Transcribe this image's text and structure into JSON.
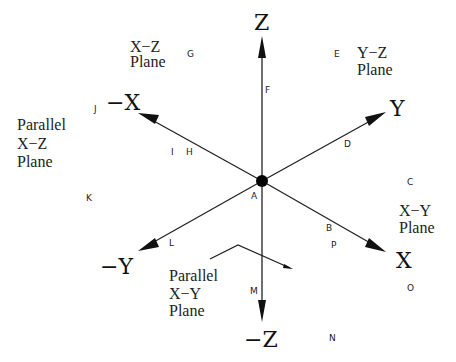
{
  "diagram": {
    "origin": {
      "label": "A",
      "x": 262,
      "y": 181
    },
    "axes": {
      "z_pos": {
        "label": "Z"
      },
      "z_neg": {
        "label": "−Z"
      },
      "y_pos": {
        "label": "Y"
      },
      "y_neg": {
        "label": "−Y"
      },
      "x_pos": {
        "label": "X"
      },
      "x_neg": {
        "label": "−X"
      }
    },
    "planes": {
      "xz": {
        "line1": "X−Z",
        "line2": "Plane"
      },
      "yz": {
        "line1": "Y−Z",
        "line2": "Plane"
      },
      "xy": {
        "line1": "X−Y",
        "line2": "Plane"
      },
      "parallel_xz": {
        "line1": "Parallel",
        "line2": "X−Z",
        "line3": "Plane"
      },
      "parallel_xy": {
        "line1": "Parallel",
        "line2": "X−Y",
        "line3": "Plane"
      }
    },
    "points": {
      "A": "A",
      "B": "B",
      "C": "C",
      "D": "D",
      "E": "E",
      "F": "F",
      "G": "G",
      "H": "H",
      "I": "I",
      "J": "J",
      "K": "K",
      "L": "L",
      "M": "M",
      "N": "N",
      "O": "O",
      "P": "P"
    }
  }
}
